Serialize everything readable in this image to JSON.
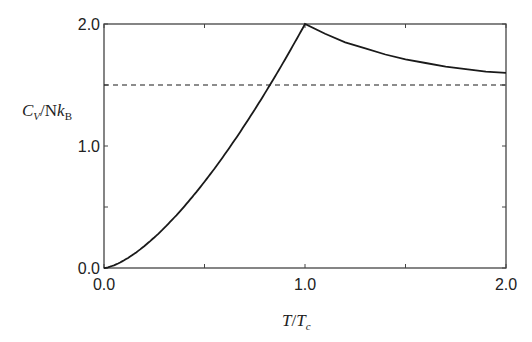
{
  "chart_data": {
    "type": "line",
    "title": "",
    "xlabel": "T/T_c",
    "ylabel": "C_V/Nk_B",
    "xlim": [
      0.0,
      2.0
    ],
    "ylim": [
      0.0,
      2.0
    ],
    "x_ticks": [
      "0.0",
      "1.0",
      "2.0"
    ],
    "y_ticks": [
      "0.0",
      "1.0",
      "2.0"
    ],
    "grid": false,
    "legend": null,
    "series": [
      {
        "name": "C_V/Nk_B (Bose gas)",
        "style": "solid",
        "x": [
          0.0,
          0.1,
          0.2,
          0.3,
          0.4,
          0.5,
          0.6,
          0.7,
          0.8,
          0.9,
          1.0,
          1.1,
          1.2,
          1.3,
          1.4,
          1.5,
          1.6,
          1.7,
          1.8,
          1.9,
          2.0
        ],
        "values": [
          0.0,
          0.06,
          0.18,
          0.33,
          0.51,
          0.71,
          0.93,
          1.17,
          1.43,
          1.71,
          2.0,
          1.92,
          1.85,
          1.8,
          1.75,
          1.71,
          1.68,
          1.65,
          1.63,
          1.61,
          1.6
        ]
      },
      {
        "name": "Classical limit 3/2",
        "style": "dashed",
        "x": [
          0.0,
          2.0
        ],
        "values": [
          1.5,
          1.5
        ]
      }
    ]
  },
  "labels": {
    "x_axis": {
      "main": "T",
      "slash": "/",
      "sub_main": "T",
      "sub": "c"
    },
    "y_axis": {
      "c": "C",
      "c_sub": "V",
      "slash": "/N",
      "k": "k",
      "k_sub": "B"
    }
  }
}
